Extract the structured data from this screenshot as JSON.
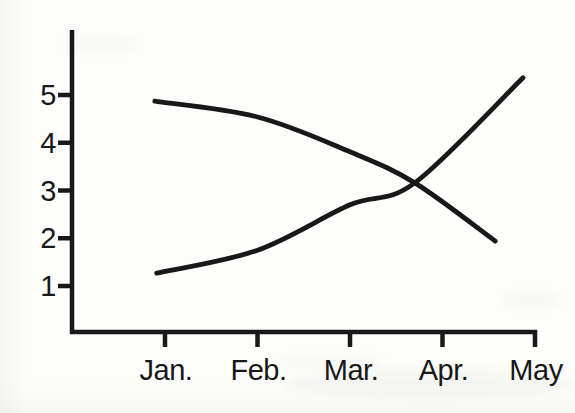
{
  "figure": {
    "background_color": "#fdfdfc",
    "ink_color": "#181818"
  },
  "chart_data": {
    "type": "line",
    "title": "",
    "xlabel": "",
    "ylabel": "",
    "x_tick_labels": [
      "Jan.",
      "Feb.",
      "Mar.",
      "Apr.",
      "May"
    ],
    "x_tick_values": [
      1,
      2,
      3,
      4,
      5
    ],
    "y_tick_labels": [
      "1",
      "2",
      "3",
      "4",
      "5"
    ],
    "y_tick_values": [
      1,
      2,
      3,
      4,
      5
    ],
    "xlim": [
      0,
      5.5
    ],
    "ylim": [
      0,
      6.3
    ],
    "grid": false,
    "legend_position": "none",
    "series": [
      {
        "name": "declining curve",
        "style": "solid",
        "points": [
          [
            0.89,
            4.87
          ],
          [
            2.0,
            4.54
          ],
          [
            3.0,
            3.81
          ],
          [
            3.7,
            3.16
          ],
          [
            4.57,
            1.94
          ]
        ]
      },
      {
        "name": "rising curve",
        "style": "solid",
        "points": [
          [
            0.91,
            1.27
          ],
          [
            2.0,
            1.75
          ],
          [
            3.0,
            2.7
          ],
          [
            3.7,
            3.16
          ],
          [
            4.87,
            5.36
          ]
        ]
      }
    ]
  }
}
